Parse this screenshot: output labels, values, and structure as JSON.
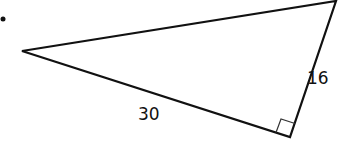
{
  "diagram": {
    "type": "right-triangle",
    "bullet": "•",
    "vertices": {
      "left": [
        22,
        51
      ],
      "top_right": [
        336,
        1
      ],
      "right_angle": [
        290,
        137
      ]
    },
    "sides": [
      {
        "name": "leg-bottom",
        "label": "30"
      },
      {
        "name": "leg-right",
        "label": "16"
      }
    ],
    "right_angle_marker": true,
    "stroke_color": "#111111"
  }
}
